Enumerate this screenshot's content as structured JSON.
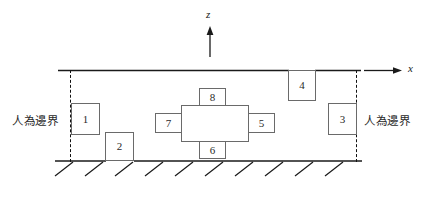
{
  "diagram": {
    "axes": {
      "z_label": "z",
      "x_label": "x"
    },
    "boundary_labels": {
      "left": "人為邊界",
      "right": "人為邊界"
    },
    "boxes": [
      {
        "id": "1",
        "label": "1",
        "position": "left-boundary"
      },
      {
        "id": "2",
        "label": "2",
        "position": "on-ground"
      },
      {
        "id": "3",
        "label": "3",
        "position": "right-boundary"
      },
      {
        "id": "4",
        "label": "4",
        "position": "hanging-from-top"
      },
      {
        "id": "5",
        "label": "5",
        "position": "cross-right"
      },
      {
        "id": "6",
        "label": "6",
        "position": "cross-bottom"
      },
      {
        "id": "7",
        "label": "7",
        "position": "cross-left"
      },
      {
        "id": "8",
        "label": "8",
        "position": "cross-top"
      }
    ],
    "center_symbol": "rotation-arrow-icon",
    "ground": "hatched-ground",
    "colors": {
      "line": "#1a1a1a",
      "box_border": "#6a6a6a",
      "dashed": "#111111",
      "text": "#2a2a2a"
    }
  }
}
